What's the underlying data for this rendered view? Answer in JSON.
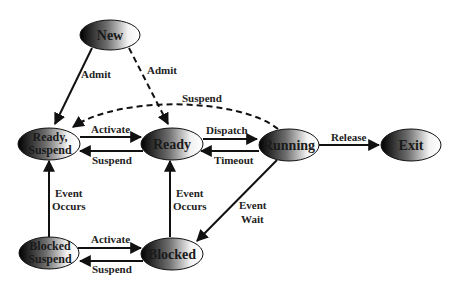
{
  "diagram": {
    "nodes": [
      {
        "id": "new",
        "label": "New",
        "cx": 110,
        "cy": 35,
        "rx": 30,
        "ry": 15
      },
      {
        "id": "ready_suspend",
        "label_line1": "Ready,",
        "label_line2": "Suspend",
        "cx": 50,
        "cy": 143,
        "rx": 30,
        "ry": 16
      },
      {
        "id": "ready",
        "label": "Ready",
        "cx": 173,
        "cy": 143,
        "rx": 30,
        "ry": 16
      },
      {
        "id": "running",
        "label": "Running",
        "cx": 289,
        "cy": 145,
        "rx": 30,
        "ry": 16
      },
      {
        "id": "exit",
        "label": "Exit",
        "cx": 411,
        "cy": 145,
        "rx": 30,
        "ry": 16
      },
      {
        "id": "blocked_suspend",
        "label_line1": "Blocked",
        "label_line2": "Suspend",
        "cx": 50,
        "cy": 253,
        "rx": 30,
        "ry": 16
      },
      {
        "id": "blocked",
        "label": "Blocked",
        "cx": 173,
        "cy": 253,
        "rx": 30,
        "ry": 16
      }
    ],
    "edges": [
      {
        "from": "new",
        "to": "ready_suspend",
        "label": "Admit",
        "style": "solid"
      },
      {
        "from": "new",
        "to": "ready",
        "label": "Admit",
        "style": "dashed"
      },
      {
        "from": "running",
        "to": "ready_suspend",
        "label": "Suspend",
        "style": "dashed"
      },
      {
        "from": "ready_suspend",
        "to": "ready",
        "label": "Activate",
        "style": "solid"
      },
      {
        "from": "ready",
        "to": "ready_suspend",
        "label": "Suspend",
        "style": "solid"
      },
      {
        "from": "ready",
        "to": "running",
        "label": "Dispatch",
        "style": "solid"
      },
      {
        "from": "running",
        "to": "ready",
        "label": "Timeout",
        "style": "solid"
      },
      {
        "from": "running",
        "to": "exit",
        "label": "Release",
        "style": "solid"
      },
      {
        "from": "running",
        "to": "blocked",
        "label_line1": "Event",
        "label_line2": "Wait",
        "style": "solid"
      },
      {
        "from": "blocked_suspend",
        "to": "ready_suspend",
        "label_line1": "Event",
        "label_line2": "Occurs",
        "style": "solid"
      },
      {
        "from": "blocked",
        "to": "ready",
        "label_line1": "Event",
        "label_line2": "Occurs",
        "style": "solid"
      },
      {
        "from": "blocked_suspend",
        "to": "blocked",
        "label": "Activate",
        "style": "solid"
      },
      {
        "from": "blocked",
        "to": "blocked_suspend",
        "label": "Suspend",
        "style": "solid"
      }
    ]
  }
}
